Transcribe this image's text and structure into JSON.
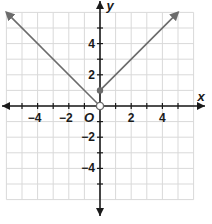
{
  "chart_data": {
    "type": "line",
    "title": "",
    "xlabel": "x",
    "ylabel": "y",
    "origin_label": "O",
    "xlim": [
      -6,
      6
    ],
    "ylim": [
      -6,
      6
    ],
    "grid": true,
    "x_ticks": [
      -4,
      -2,
      2,
      4
    ],
    "y_ticks": [
      4,
      2,
      -2,
      -4
    ],
    "x_tick_labels": [
      "−4",
      "−2",
      "2",
      "4"
    ],
    "y_tick_labels": [
      "4",
      "2",
      "−2",
      "−4"
    ],
    "series": [
      {
        "name": "left ray",
        "points": [
          [
            0,
            0
          ],
          [
            -6,
            6
          ]
        ],
        "start_point": "open",
        "end": "arrow",
        "color": "#6b6b6b"
      },
      {
        "name": "right ray",
        "points": [
          [
            0,
            1
          ],
          [
            5,
            6
          ]
        ],
        "start_point": "closed",
        "end": "arrow",
        "color": "#6b6b6b"
      }
    ],
    "markers": [
      {
        "x": 0,
        "y": 0,
        "type": "open-circle"
      },
      {
        "x": 0,
        "y": 1,
        "type": "closed-dot"
      }
    ]
  }
}
